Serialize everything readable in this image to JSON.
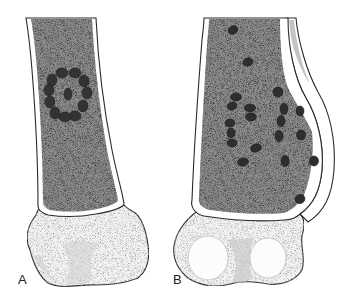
{
  "figure": {
    "panels": [
      {
        "id": "A",
        "label": "A",
        "description": "Distal femur with ring-shaped cluster of lesions (central focus surrounded by ring) in medullary cavity",
        "lesion_pattern": "ring",
        "ring_center": [
          68,
          90
        ],
        "ring_dot_count": 12,
        "central_dot": [
          68,
          90
        ]
      },
      {
        "id": "B",
        "label": "B",
        "description": "Distal femur with scattered lesions throughout medullary cavity and periosteal reaction along lateral cortex",
        "lesion_pattern": "scattered",
        "dots": [
          [
            233,
            30
          ],
          [
            248,
            62
          ],
          [
            278,
            92
          ],
          [
            236,
            98
          ],
          [
            232,
            107
          ],
          [
            250,
            109
          ],
          [
            251,
            118
          ],
          [
            230,
            123
          ],
          [
            231,
            133
          ],
          [
            232,
            143
          ],
          [
            284,
            109
          ],
          [
            281,
            121
          ],
          [
            279,
            136
          ],
          [
            300,
            111
          ],
          [
            301,
            135
          ],
          [
            255,
            148
          ],
          [
            243,
            162
          ],
          [
            257,
            164
          ],
          [
            284,
            161
          ],
          [
            315,
            162
          ],
          [
            300,
            199
          ]
        ]
      }
    ],
    "colors": {
      "medulla": "#8e8e8e",
      "cortex": "#ffffff",
      "outline": "#2a2a2a",
      "lesion": "#2e2e2e",
      "epiphysis": "#f2f2f2"
    }
  }
}
